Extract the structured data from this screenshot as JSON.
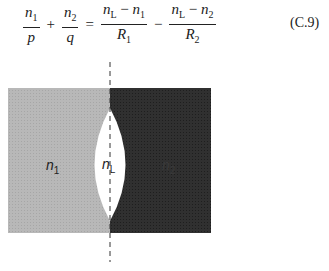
{
  "equation": {
    "term1": {
      "num": "n",
      "num_sub": "1",
      "den": "p"
    },
    "op1": "+",
    "term2": {
      "num": "n",
      "num_sub": "2",
      "den": "q"
    },
    "eq": "=",
    "term3": {
      "num_a": "n",
      "num_a_sub": "L",
      "minus": " − ",
      "num_b": "n",
      "num_b_sub": "1",
      "den": "R",
      "den_sub": "1"
    },
    "op2": "−",
    "term4": {
      "num_a": "n",
      "num_a_sub": "L",
      "minus": " − ",
      "num_b": "n",
      "num_b_sub": "2",
      "den": "R",
      "den_sub": "2"
    },
    "number": "(C.9)"
  },
  "figure": {
    "labels": {
      "left_medium": {
        "n": "n",
        "sub": "1"
      },
      "lens": {
        "n": "n",
        "sub": "L"
      },
      "right_medium": {
        "n": "n",
        "sub": "2"
      }
    },
    "colors": {
      "left_medium": "#b4b4b4",
      "right_medium": "#2e2e2e",
      "lens": "#ffffff",
      "axis": "#333333"
    }
  }
}
